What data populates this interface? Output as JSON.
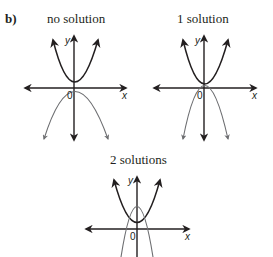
{
  "part_label": "b)",
  "graphs": [
    {
      "title": "no solution",
      "axis_x": "x",
      "axis_y": "y",
      "origin": "0",
      "up_parabola": "vertex above x-axis",
      "down_parabola": "vertex below x-axis"
    },
    {
      "title": "1 solution",
      "axis_x": "x",
      "axis_y": "y",
      "origin": "0",
      "up_parabola": "vertex touching down-parabola at one point",
      "down_parabola": "vertex touching up-parabola at one point"
    },
    {
      "title": "2 solutions",
      "axis_x": "x",
      "axis_y": "y",
      "origin": "0",
      "up_parabola": "intersects down-parabola at two points",
      "down_parabola": "intersects up-parabola at two points"
    }
  ],
  "colors": {
    "ink": "#231f20",
    "up_curve": "#231f20",
    "down_curve": "#6d6e71"
  }
}
